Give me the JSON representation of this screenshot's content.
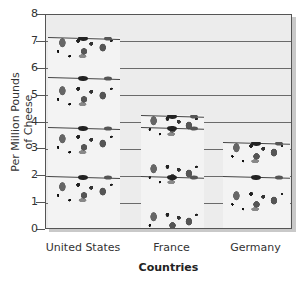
{
  "chart_data": {
    "type": "bar",
    "title": "",
    "xlabel": "Countries",
    "ylabel": "Per Million Pounds of Cheese",
    "ylabel_lines": [
      "Per Million Pounds",
      "of Cheese"
    ],
    "categories": [
      "United States",
      "France",
      "Germany"
    ],
    "values": [
      7.1,
      4.2,
      3.2
    ],
    "ylim": [
      0,
      8
    ],
    "yticks": [
      0,
      1,
      2,
      3,
      4,
      5,
      6,
      7,
      8
    ],
    "grid": true,
    "bar_style": "pictograph (stacked cheese wedges)",
    "colors": {
      "plot_background": "#ececec",
      "gridline": "#6a6a6a",
      "bar_fill": "#f3f3f3",
      "holes": "#555555"
    }
  }
}
